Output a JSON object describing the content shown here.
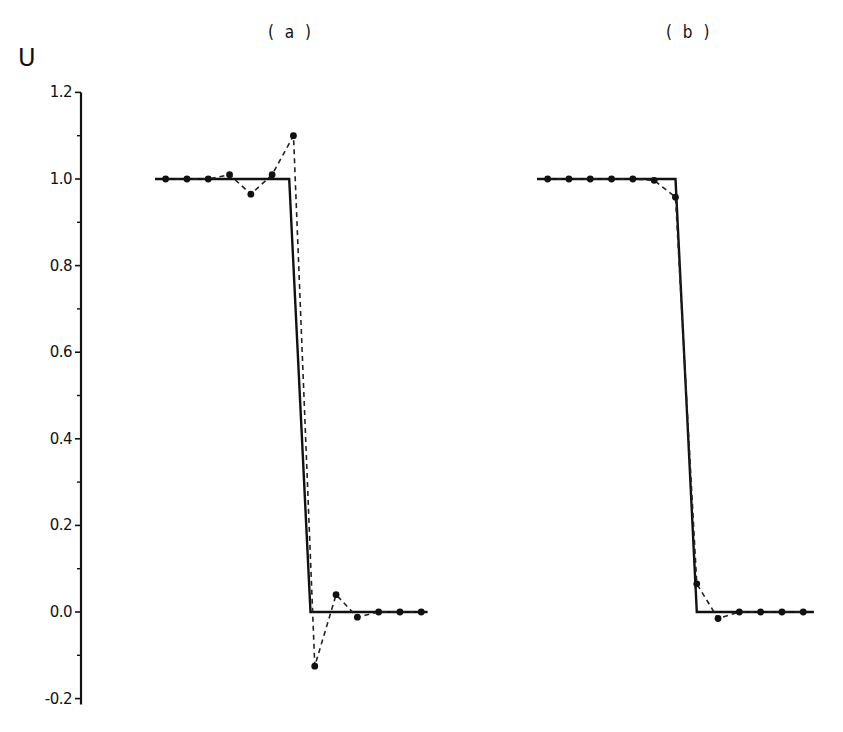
{
  "figure": {
    "panel_titles": [
      "( a )",
      "( b )"
    ],
    "y_axis_label": "U"
  },
  "chart_data": [
    {
      "type": "line",
      "title": "( a )",
      "xlabel": "",
      "ylabel": "U",
      "ylim": [
        -0.2,
        1.2
      ],
      "yticks": [
        -0.2,
        0.0,
        0.2,
        0.4,
        0.6,
        0.8,
        1.0,
        1.2
      ],
      "ytick_labels": [
        "-0.2",
        "0.0",
        "0.2",
        "0.4",
        "0.6",
        "0.8",
        "1.0",
        "1.2"
      ],
      "grid": false,
      "series": [
        {
          "name": "exact solution",
          "style": "solid",
          "x": [
            0,
            6.3,
            7.3,
            12.8
          ],
          "values": [
            1.0,
            1.0,
            0.0,
            0.0
          ]
        },
        {
          "name": "numerical solution",
          "style": "dashed-with-markers",
          "x": [
            0.5,
            1.5,
            2.5,
            3.5,
            4.5,
            5.5,
            6.5,
            7.5,
            8.5,
            9.5,
            10.5,
            11.5,
            12.5
          ],
          "values": [
            1.0,
            1.0,
            1.0,
            1.01,
            0.965,
            1.01,
            1.1,
            -0.125,
            0.04,
            -0.012,
            0.0,
            0.0,
            0.0
          ]
        }
      ]
    },
    {
      "type": "line",
      "title": "( b )",
      "xlabel": "",
      "ylabel": "U",
      "ylim": [
        -0.2,
        1.2
      ],
      "grid": false,
      "series": [
        {
          "name": "exact solution",
          "style": "solid",
          "x": [
            0,
            6.5,
            7.5,
            13.0
          ],
          "values": [
            1.0,
            1.0,
            0.0,
            0.0
          ]
        },
        {
          "name": "numerical solution",
          "style": "dashed-with-markers",
          "x": [
            0.5,
            1.5,
            2.5,
            3.5,
            4.5,
            5.5,
            6.5,
            7.5,
            8.5,
            9.5,
            10.5,
            11.5,
            12.5
          ],
          "values": [
            1.0,
            1.0,
            1.0,
            1.0,
            1.0,
            0.997,
            0.958,
            0.065,
            -0.015,
            0.0,
            0.0,
            0.0,
            0.0
          ]
        }
      ]
    }
  ],
  "layout": {
    "axis_x": 81,
    "y_zero_px": 612,
    "px_per_unit": 433,
    "panels": [
      {
        "x0_px": 155,
        "dx_px": 21.3
      },
      {
        "x0_px": 537,
        "dx_px": 21.3
      }
    ]
  }
}
